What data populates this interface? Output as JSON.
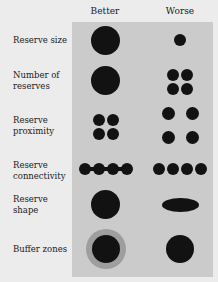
{
  "columns": {
    "better": "Better",
    "worse": "Worse"
  },
  "rows": [
    {
      "label": "Reserve size",
      "better": "one large reserve",
      "worse": "one small reserve"
    },
    {
      "label": "Number of reserves",
      "better": "one large reserve",
      "worse": "four small reserves"
    },
    {
      "label": "Reserve proximity",
      "better": "four reserves clustered close",
      "worse": "four reserves spread apart"
    },
    {
      "label": "Reserve connectivity",
      "better": "four reserves linked by corridors",
      "worse": "four unconnected reserves"
    },
    {
      "label": "Reserve shape",
      "better": "round reserve",
      "worse": "elongated elliptical reserve"
    },
    {
      "label": "Buffer zones",
      "better": "reserve with surrounding buffer zone",
      "worse": "reserve without buffer zone"
    }
  ],
  "label_lines": {
    "size": [
      "Reserve size"
    ],
    "number": [
      "Number of",
      "reserves"
    ],
    "proximity": [
      "Reserve",
      "proximity"
    ],
    "connectivity": [
      "Reserve",
      "connectivity"
    ],
    "shape": [
      "Reserve",
      "shape"
    ],
    "buffer": [
      "Buffer zones"
    ]
  },
  "colors": {
    "panel": "#cbcbcb",
    "reserve": "#121212",
    "buffer": "#9e9e9e",
    "background": "#ececec"
  }
}
